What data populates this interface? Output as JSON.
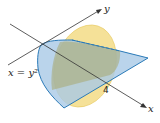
{
  "diagram": {
    "labels": {
      "y_axis": "y",
      "x_axis": "x",
      "curve": "x = y²",
      "tick": "4"
    },
    "colors": {
      "blue_fill": "#b9d3ea",
      "blue_edge": "#2a7ab8",
      "yellow_fill": "#f3dc86",
      "overlap_fill": "#b9b98a",
      "axis": "#333333"
    }
  }
}
